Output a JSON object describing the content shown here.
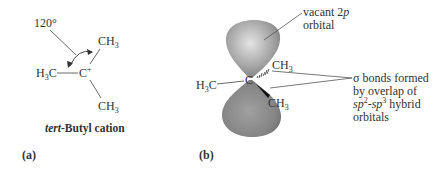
{
  "panel_a": {
    "label": "(a)",
    "angle_label": "120°",
    "left_group": "H3C",
    "left_group_main": "H",
    "left_group_sub": "3",
    "left_group_tail": "C",
    "center_atom": "C",
    "center_charge": "+",
    "top_group_main": "CH",
    "top_group_sub": "3",
    "bottom_group_main": "CH",
    "bottom_group_sub": "3",
    "caption_italic": "tert",
    "caption_rest": "-Butyl cation"
  },
  "panel_b": {
    "label": "(b)",
    "center_atom": "C",
    "left_group_main": "H",
    "left_group_sub": "3",
    "left_group_tail": "C",
    "upper_right_main": "CH",
    "upper_right_sub": "3",
    "lower_right_main": "CH",
    "lower_right_sub": "3",
    "orbital_label_line1_a": "vacant 2",
    "orbital_label_line1_b": "p",
    "orbital_label_line2": "orbital",
    "sigma_line1": "σ bonds formed",
    "sigma_line2": "by overlap of",
    "sigma_line3_a": "sp",
    "sigma_line3_b": "2",
    "sigma_line3_c": "-",
    "sigma_line3_d": "sp",
    "sigma_line3_e": "3",
    "sigma_line3_f": " hybrid",
    "sigma_line4": "orbitals"
  },
  "colors": {
    "lobe_light": "#d8d8d8",
    "lobe_dark": "#7a7a7a",
    "text": "#333333",
    "line": "#555555"
  }
}
